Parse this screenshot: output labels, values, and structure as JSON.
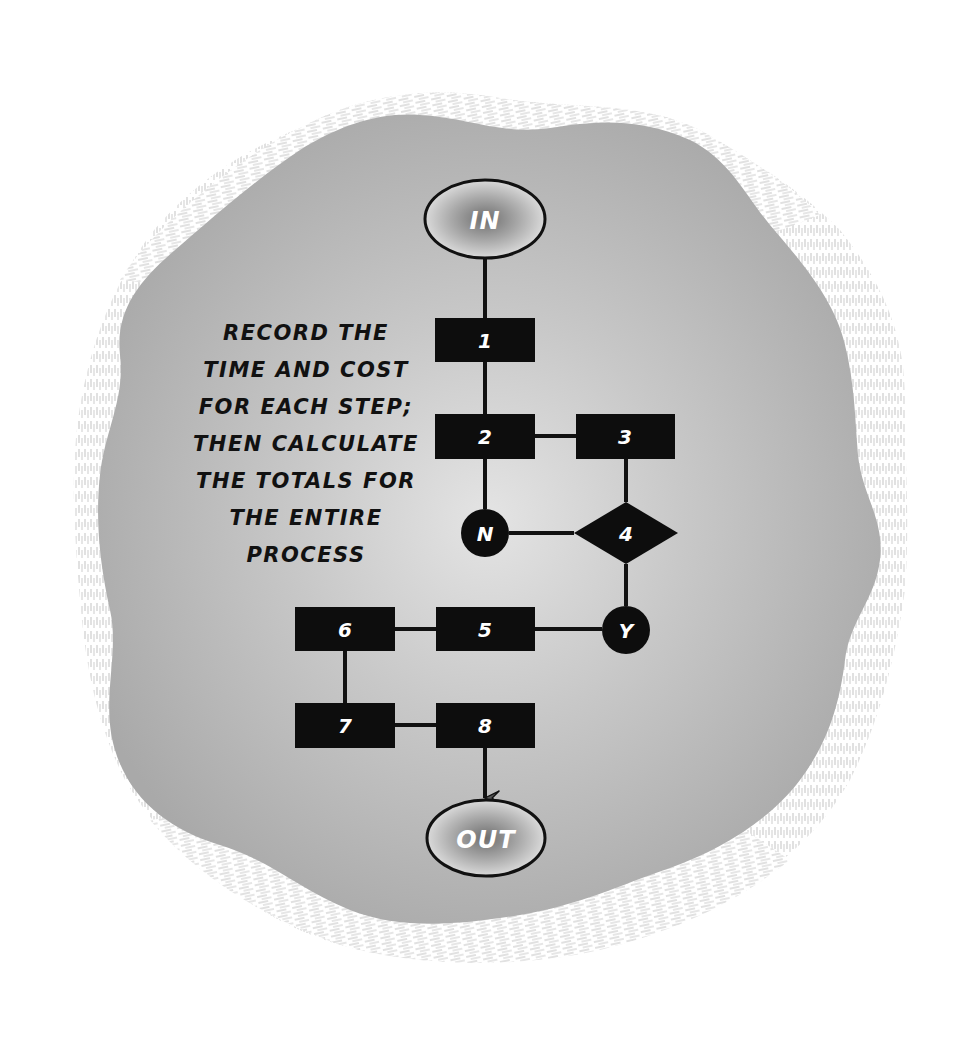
{
  "diagram": {
    "type": "flowchart",
    "colors": {
      "background": "#ffffff",
      "blob_fill": "#b3b3b3",
      "blob_hatch": "#c8c8c8",
      "node_fill": "#0d0d0d",
      "node_text": "#ffffff",
      "terminal_center": "#7a7a7a",
      "terminal_edge": "#d6d6d6",
      "note_text": "#111111"
    },
    "terminals": {
      "start": {
        "label": "IN",
        "cx": 485,
        "cy": 219,
        "rx": 60,
        "ry": 39
      },
      "end": {
        "label": "OUT",
        "cx": 486,
        "cy": 838,
        "rx": 59,
        "ry": 38
      }
    },
    "nodes": [
      {
        "id": "1",
        "label": "1",
        "shape": "rect",
        "x": 435,
        "y": 318,
        "w": 100,
        "h": 44
      },
      {
        "id": "2",
        "label": "2",
        "shape": "rect",
        "x": 435,
        "y": 414,
        "w": 100,
        "h": 45
      },
      {
        "id": "3",
        "label": "3",
        "shape": "rect",
        "x": 576,
        "y": 414,
        "w": 99,
        "h": 45
      },
      {
        "id": "4",
        "label": "4",
        "shape": "diamond",
        "cx": 626,
        "cy": 533,
        "hw": 52,
        "hh": 31
      },
      {
        "id": "N",
        "label": "N",
        "shape": "circle",
        "cx": 485,
        "cy": 533,
        "r": 24
      },
      {
        "id": "Y",
        "label": "Y",
        "shape": "circle",
        "cx": 626,
        "cy": 630,
        "r": 24
      },
      {
        "id": "5",
        "label": "5",
        "shape": "rect",
        "x": 436,
        "y": 607,
        "w": 99,
        "h": 44
      },
      {
        "id": "6",
        "label": "6",
        "shape": "rect",
        "x": 295,
        "y": 607,
        "w": 100,
        "h": 44
      },
      {
        "id": "7",
        "label": "7",
        "shape": "rect",
        "x": 295,
        "y": 703,
        "w": 100,
        "h": 45
      },
      {
        "id": "8",
        "label": "8",
        "shape": "rect",
        "x": 436,
        "y": 703,
        "w": 99,
        "h": 45
      }
    ],
    "edges": [
      {
        "from": "IN",
        "to": "1"
      },
      {
        "from": "1",
        "to": "2"
      },
      {
        "from": "2",
        "to": "3"
      },
      {
        "from": "2",
        "to": "N"
      },
      {
        "from": "3",
        "to": "4"
      },
      {
        "from": "N",
        "to": "4"
      },
      {
        "from": "4",
        "to": "Y"
      },
      {
        "from": "Y",
        "to": "5"
      },
      {
        "from": "5",
        "to": "6"
      },
      {
        "from": "6",
        "to": "7"
      },
      {
        "from": "7",
        "to": "8"
      },
      {
        "from": "8",
        "to": "OUT",
        "arrow": true
      }
    ],
    "note": {
      "lines": [
        "RECORD THE",
        "TIME AND COST",
        "FOR EACH STEP;",
        "THEN CALCULATE",
        "THE TOTALS FOR",
        "THE ENTIRE",
        "PROCESS"
      ]
    }
  }
}
